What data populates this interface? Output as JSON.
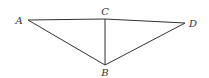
{
  "diagram": {
    "type": "geometry-figure",
    "points": [
      {
        "id": "A",
        "label": "A",
        "x": 28,
        "y": 20,
        "label_x": 19,
        "label_y": 24
      },
      {
        "id": "C",
        "label": "C",
        "x": 105,
        "y": 19,
        "label_x": 105,
        "label_y": 15
      },
      {
        "id": "D",
        "label": "D",
        "x": 185,
        "y": 23,
        "label_x": 193,
        "label_y": 27
      },
      {
        "id": "B",
        "label": "B",
        "x": 105,
        "y": 65,
        "label_x": 105,
        "label_y": 76
      }
    ],
    "edges": [
      {
        "from": "A",
        "to": "C"
      },
      {
        "from": "C",
        "to": "D"
      },
      {
        "from": "A",
        "to": "B"
      },
      {
        "from": "C",
        "to": "B"
      },
      {
        "from": "D",
        "to": "B"
      }
    ],
    "stroke_color": "#333333"
  }
}
